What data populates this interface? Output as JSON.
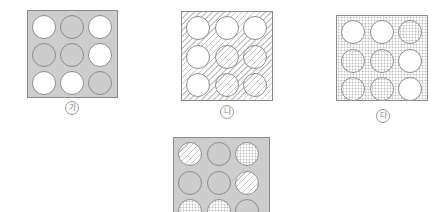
{
  "figures": [
    {
      "id": "ga",
      "label": "가",
      "background": "gray",
      "grid": [
        [
          "white",
          "gray",
          "white"
        ],
        [
          "gray",
          "gray",
          "white"
        ],
        [
          "white",
          "white",
          "gray"
        ]
      ]
    },
    {
      "id": "na",
      "label": "나",
      "background": "hatch",
      "grid": [
        [
          "white",
          "white",
          "white"
        ],
        [
          "white",
          "hatch",
          "hatch"
        ],
        [
          "white",
          "hatch",
          "hatch"
        ]
      ]
    },
    {
      "id": "da",
      "label": "다",
      "background": "dot",
      "grid": [
        [
          "white",
          "white",
          "dot"
        ],
        [
          "dot",
          "dot",
          "white"
        ],
        [
          "dot",
          "dot",
          "white"
        ]
      ]
    },
    {
      "id": "result",
      "label": "",
      "background": "gray",
      "grid": [
        [
          "hatch",
          "gray",
          "dot"
        ],
        [
          "gray",
          "gray",
          "hatch"
        ],
        [
          "dot",
          "dot",
          "gray"
        ]
      ]
    }
  ],
  "colors": {
    "gray_fill": "#cdcdcd",
    "outline": "#8a8a8a",
    "pattern": "#c8c8c8"
  }
}
